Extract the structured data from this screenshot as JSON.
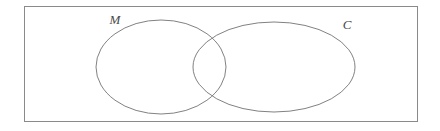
{
  "figure": {
    "kind": "venn-diagram",
    "title": "",
    "background_color": "#ffffff",
    "universe": {
      "name": "universal-set-rectangle",
      "label": "",
      "x": 24,
      "y": 6,
      "width": 394,
      "height": 116,
      "stroke_color": "#8a8a8a",
      "stroke_width": 1,
      "fill": "none"
    },
    "sets": [
      {
        "id": "M",
        "label": "M",
        "shape": "ellipse",
        "cx": 161,
        "cy": 67,
        "rx": 65,
        "ry": 47,
        "stroke_color": "#737373",
        "stroke_width": 0.9,
        "fill": "none",
        "label_x": 115,
        "label_y": 24,
        "label_style": "italic-serif"
      },
      {
        "id": "C",
        "label": "C",
        "shape": "ellipse",
        "cx": 274,
        "cy": 67,
        "rx": 81,
        "ry": 45,
        "stroke_color": "#737373",
        "stroke_width": 0.9,
        "fill": "none",
        "label_x": 347,
        "label_y": 29,
        "label_style": "italic-serif"
      }
    ],
    "intersection": {
      "name": "M-intersect-C",
      "label": "",
      "top_crossing_x": 227,
      "top_crossing_y": 31,
      "bottom_crossing_x": 227,
      "bottom_crossing_y": 108
    },
    "colors": {
      "stroke": "#737373",
      "frame": "#8a8a8a",
      "label": "#4a4a4a",
      "background": "#ffffff"
    }
  }
}
